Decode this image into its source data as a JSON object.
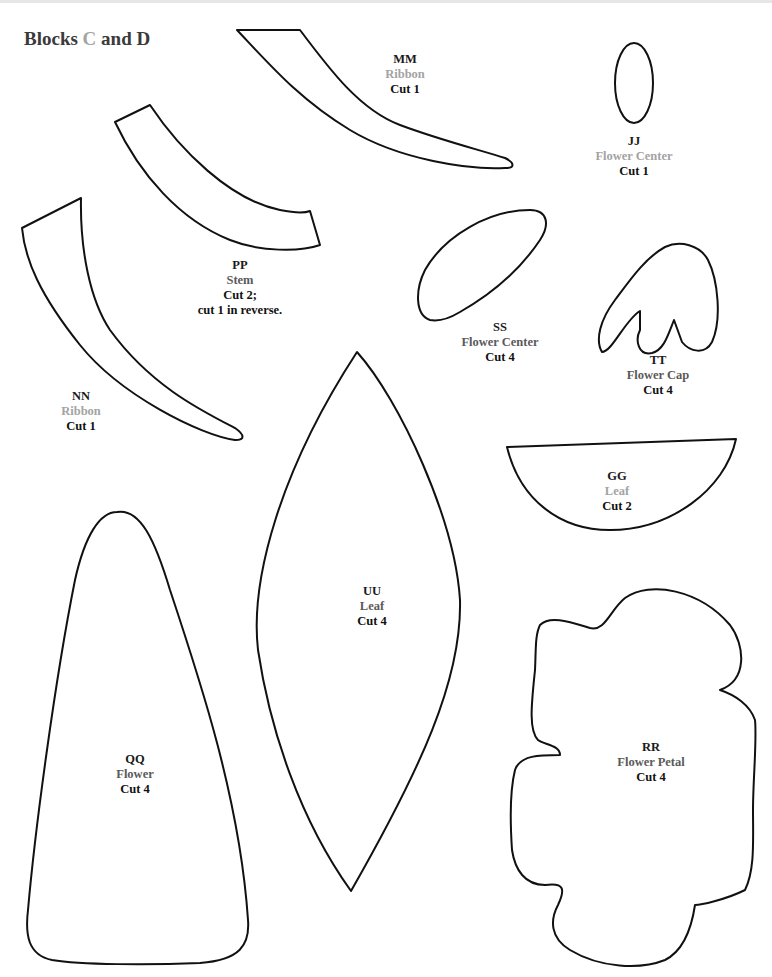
{
  "page": {
    "title_prefix": "Blocks ",
    "title_accent": "C",
    "title_suffix": " and D"
  },
  "colors": {
    "stroke": "#111111",
    "light_gray": "#a3a3a3",
    "dark_gray": "#5a5a5a",
    "text": "#111111"
  },
  "pieces": {
    "mm": {
      "code": "MM",
      "name": "Ribbon",
      "cut": "Cut 1"
    },
    "jj": {
      "code": "JJ",
      "name": "Flower Center",
      "cut": "Cut 1"
    },
    "pp": {
      "code": "PP",
      "name": "Stem",
      "cut": "Cut 2;",
      "note": "cut 1 in reverse."
    },
    "ss": {
      "code": "SS",
      "name": "Flower Center",
      "cut": "Cut 4"
    },
    "tt": {
      "code": "TT",
      "name": "Flower Cap",
      "cut": "Cut 4"
    },
    "nn": {
      "code": "NN",
      "name": "Ribbon",
      "cut": "Cut 1"
    },
    "gg": {
      "code": "GG",
      "name": "Leaf",
      "cut": "Cut 2"
    },
    "uu": {
      "code": "UU",
      "name": "Leaf",
      "cut": "Cut 4"
    },
    "qq": {
      "code": "QQ",
      "name": "Flower",
      "cut": "Cut 4"
    },
    "rr": {
      "code": "RR",
      "name": "Flower Petal",
      "cut": "Cut 4"
    }
  }
}
